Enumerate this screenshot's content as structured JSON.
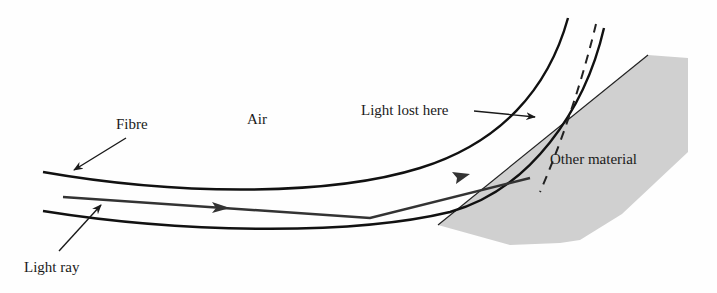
{
  "diagram": {
    "type": "optical-fibre-light-loss",
    "labels": {
      "fibre": "Fibre",
      "air": "Air",
      "light_lost": "Light lost here",
      "other_material": "Other material",
      "light_ray": "Light ray"
    },
    "colors": {
      "background": "#fefefe",
      "fibre_wall": "#111111",
      "light_ray": "#333333",
      "other_material_fill": "#d0d0d0",
      "other_material_edge": "#222222",
      "text": "#1a1a1a"
    }
  }
}
